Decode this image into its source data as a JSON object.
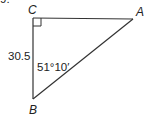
{
  "problem_number_fragment": "9.",
  "triangle": {
    "vertices": {
      "A": {
        "label": "A",
        "x": 133,
        "y": 19
      },
      "B": {
        "label": "B",
        "x": 33,
        "y": 99
      },
      "C": {
        "label": "C",
        "x": 33,
        "y": 18
      }
    },
    "right_angle_at": "C",
    "side_CB_length": "30.5",
    "angle_B": "51°10′"
  },
  "colors": {
    "stroke": "#333333",
    "text": "#222222",
    "background": "#ffffff"
  }
}
